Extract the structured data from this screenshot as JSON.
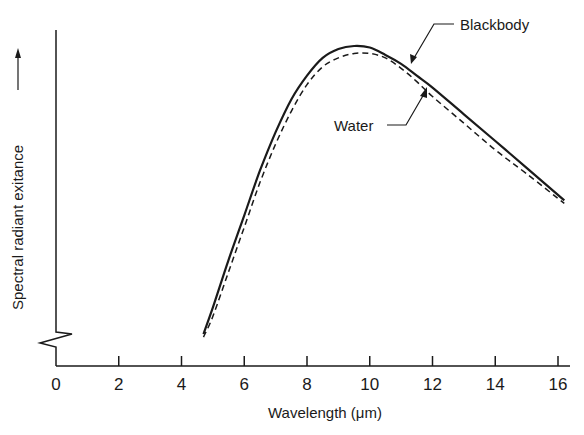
{
  "chart_data": {
    "type": "line",
    "title": "",
    "xlabel": "Wavelength (μm)",
    "ylabel": "Spectral radiant exitance",
    "ylabel_arrow": "up-arrow",
    "xlim": [
      0,
      16.4
    ],
    "x_ticks": [
      0,
      2,
      4,
      6,
      8,
      10,
      12,
      14,
      16
    ],
    "y_ticks": [],
    "y_axis_break": true,
    "grid": false,
    "legend": "none (direct annotations with leader arrows)",
    "units_note": "y-values are relative (arbitrary units, 0 = axis break, 100 = blackbody peak)",
    "series": [
      {
        "name": "Blackbody",
        "style": "solid",
        "x": [
          4.7,
          5.0,
          5.5,
          6.0,
          6.5,
          7.0,
          7.5,
          8.0,
          8.5,
          9.0,
          9.5,
          10.0,
          10.5,
          11.0,
          11.5,
          12.0,
          13.0,
          14.0,
          15.0,
          16.2
        ],
        "y": [
          3,
          12,
          28,
          43,
          58,
          71,
          82,
          90,
          96,
          99,
          100,
          99.5,
          97,
          94,
          90,
          86,
          77,
          68,
          59,
          48
        ]
      },
      {
        "name": "Water",
        "style": "dashed",
        "x": [
          4.7,
          5.0,
          5.5,
          6.0,
          6.5,
          7.0,
          7.5,
          8.0,
          8.5,
          9.0,
          9.5,
          10.0,
          10.5,
          11.0,
          11.5,
          12.0,
          13.0,
          14.0,
          15.0,
          16.2
        ],
        "y": [
          2,
          9,
          24,
          39,
          54,
          67,
          78,
          87,
          93,
          96,
          97.5,
          97.5,
          96,
          92.5,
          88,
          83,
          74,
          65,
          57,
          47
        ]
      }
    ],
    "annotations": [
      {
        "text": "Blackbody",
        "points_to_series": "Blackbody",
        "at_x": 11.4
      },
      {
        "text": "Water",
        "points_to_series": "Water",
        "at_x": 11.8
      }
    ]
  }
}
